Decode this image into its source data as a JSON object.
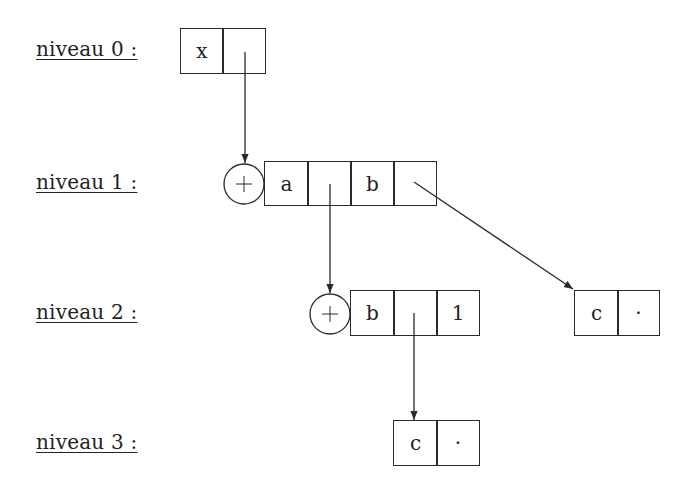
{
  "levels": [
    {
      "label": "niveau 0 :"
    },
    {
      "label": "niveau 1 :"
    },
    {
      "label": "niveau 2 :"
    },
    {
      "label": "niveau 3 :"
    }
  ],
  "nodes": {
    "level0": {
      "cells": [
        "x",
        ""
      ]
    },
    "level1": {
      "operator": "+",
      "cells": [
        "a",
        "",
        "b",
        ""
      ]
    },
    "level2_main": {
      "operator": "+",
      "cells": [
        "b",
        "",
        "1"
      ]
    },
    "level2_right": {
      "cells": [
        "c",
        "·"
      ]
    },
    "level3": {
      "cells": [
        "c",
        "·"
      ]
    }
  },
  "edges": [
    {
      "from": "level0.cell1",
      "to": "level1.operator"
    },
    {
      "from": "level1.cell1",
      "to": "level2_main.operator"
    },
    {
      "from": "level1.cell3",
      "to": "level2_right.cell0"
    },
    {
      "from": "level2_main.cell1",
      "to": "level3.cell0"
    }
  ],
  "colors": {
    "ink": "#2a2a2a",
    "background": "#ffffff"
  }
}
